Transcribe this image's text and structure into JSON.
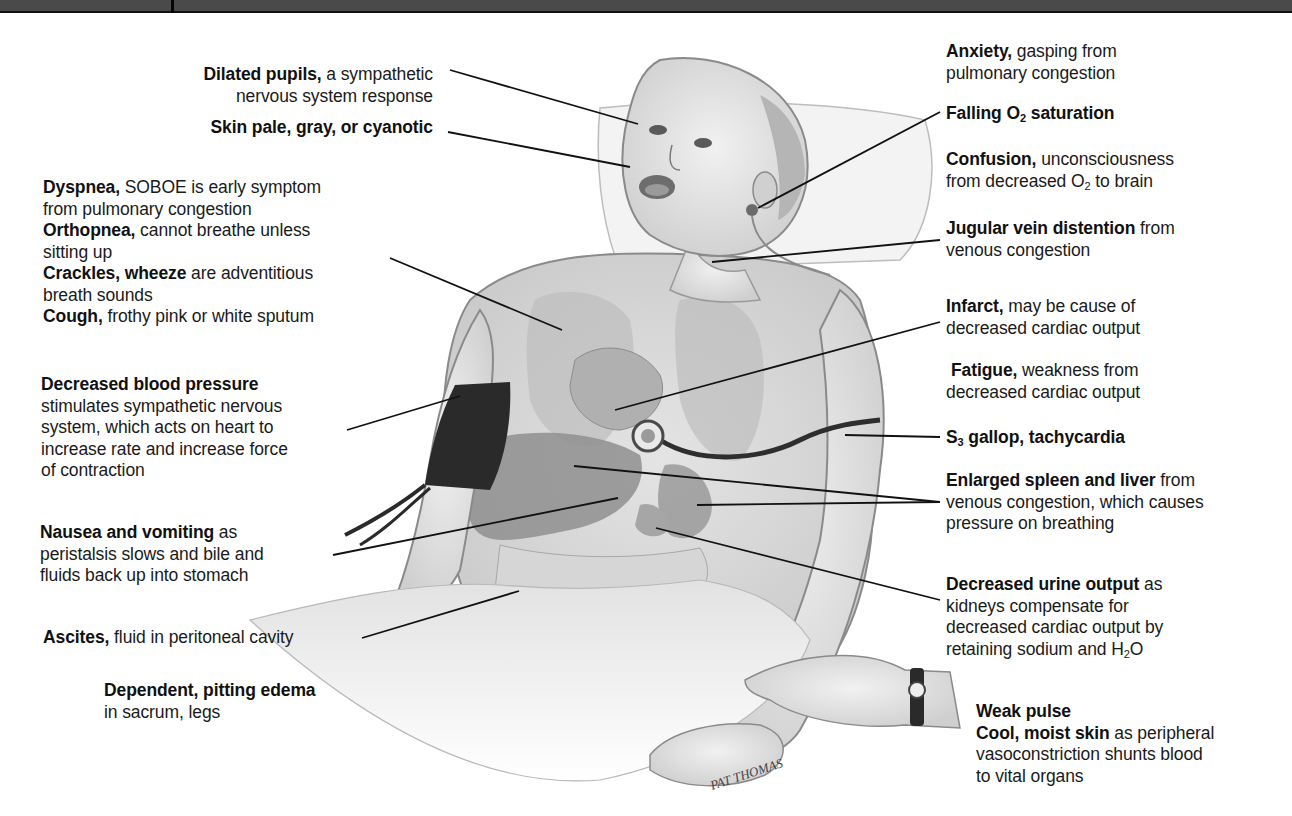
{
  "figure": {
    "signature": "PAT THOMAS"
  },
  "labels_left": {
    "dilated_pupils": {
      "bold": "Dilated pupils,",
      "rest": " a sympathetic",
      "line2": "nervous system response"
    },
    "skin": {
      "bold": "Skin pale, gray, or cyanotic"
    },
    "dyspnea": {
      "bold": "Dyspnea,",
      "rest": " SOBOE is early symptom",
      "line2": "from pulmonary congestion"
    },
    "orthopnea": {
      "bold": "Orthopnea,",
      "rest": " cannot breathe unless",
      "line2": "sitting up"
    },
    "crackles": {
      "bold": "Crackles, wheeze",
      "rest": " are adventitious",
      "line2": "breath sounds"
    },
    "cough": {
      "bold": "Cough,",
      "rest": " frothy pink or white sputum"
    },
    "blood_pressure": {
      "bold": "Decreased blood pressure",
      "line2": "stimulates sympathetic nervous",
      "line3": "system, which acts on heart to",
      "line4": "increase rate and increase force",
      "line5": "of contraction"
    },
    "nausea": {
      "bold": "Nausea and vomiting",
      "rest": " as",
      "line2": "peristalsis slows and bile and",
      "line3": "fluids back up into stomach"
    },
    "ascites": {
      "bold": "Ascites,",
      "rest": " fluid in peritoneal cavity"
    },
    "edema": {
      "bold": "Dependent, pitting edema",
      "line2": "in sacrum, legs"
    }
  },
  "labels_right": {
    "anxiety": {
      "bold": "Anxiety,",
      "rest": " gasping from",
      "line2": "pulmonary congestion"
    },
    "o2": {
      "bold_pre": "Falling O",
      "sub": "2",
      "bold_post": " saturation"
    },
    "confusion": {
      "bold": "Confusion,",
      "rest": " unconsciousness",
      "line2_pre": "from decreased O",
      "line2_sub": "2",
      "line2_post": " to brain"
    },
    "jvd": {
      "bold": "Jugular vein distention",
      "rest": " from",
      "line2": "venous congestion"
    },
    "infarct": {
      "bold": "Infarct,",
      "rest": " may be cause of",
      "line2": "decreased cardiac output"
    },
    "fatigue": {
      "bold": "Fatigue,",
      "rest": " weakness from",
      "line2": "decreased cardiac output"
    },
    "s3": {
      "bold_pre": "S",
      "sub": "3",
      "bold_post": " gallop, tachycardia"
    },
    "spleen_liver": {
      "bold": "Enlarged spleen and liver",
      "rest": " from",
      "line2": "venous congestion, which causes",
      "line3": "pressure on breathing"
    },
    "urine": {
      "bold": "Decreased urine output",
      "rest": " as",
      "line2": "kidneys compensate for",
      "line3": "decreased cardiac output by",
      "line4_pre": "retaining sodium and H",
      "line4_sub": "2",
      "line4_post": "O"
    },
    "pulse": {
      "bold": "Weak pulse"
    },
    "skin_cool": {
      "bold": "Cool, moist skin",
      "rest": " as peripheral",
      "line2": "vasoconstriction shunts blood",
      "line3": "to vital organs"
    }
  },
  "colors": {
    "top_bar": "#4a4a4a",
    "text": "#1a1a1a",
    "leader_line": "#111111",
    "cuff": "#2a2a2a",
    "organ_shade": "#9a9a9a"
  }
}
